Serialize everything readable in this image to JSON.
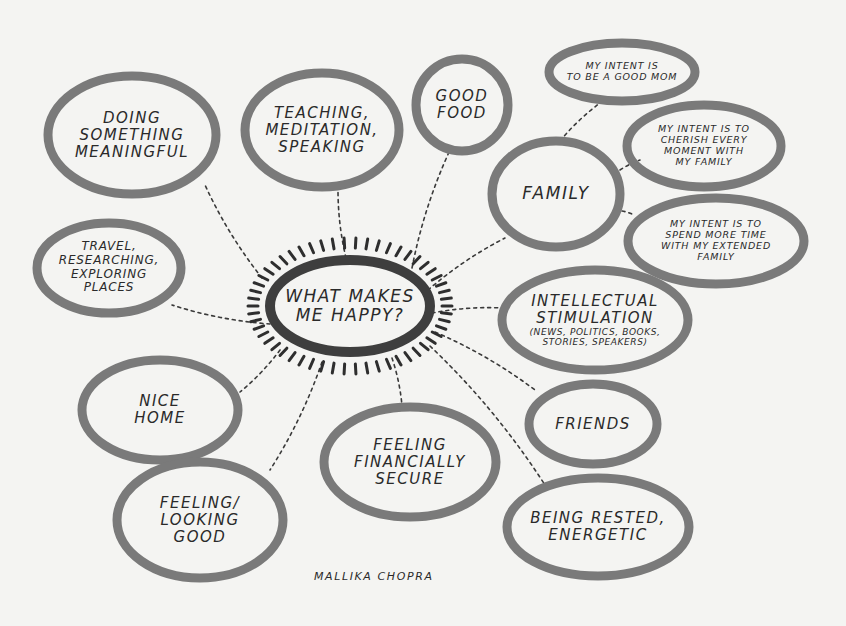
{
  "diagram": {
    "type": "mind-map",
    "center": {
      "id": "center",
      "lines": [
        "WHAT MAKES",
        "ME HAPPY?"
      ],
      "cx": 350,
      "cy": 306,
      "rx": 80,
      "ry": 46
    },
    "nodes": [
      {
        "id": "meaningful",
        "lines": [
          "DOING",
          "SOMETHING",
          "MEANINGFUL"
        ],
        "cx": 132,
        "cy": 135,
        "rx": 84,
        "ry": 59,
        "size": "med",
        "parent": "center"
      },
      {
        "id": "teaching",
        "lines": [
          "TEACHING,",
          "MEDITATION,",
          "SPEAKING"
        ],
        "cx": 322,
        "cy": 130,
        "rx": 77,
        "ry": 57,
        "size": "med",
        "parent": "center"
      },
      {
        "id": "good-food",
        "lines": [
          "GOOD",
          "FOOD"
        ],
        "cx": 462,
        "cy": 105,
        "rx": 46,
        "ry": 46,
        "size": "med",
        "parent": "center"
      },
      {
        "id": "family",
        "lines": [
          "FAMILY"
        ],
        "cx": 556,
        "cy": 194,
        "rx": 64,
        "ry": 53,
        "size": "big",
        "parent": "center"
      },
      {
        "id": "good-mom",
        "lines": [
          "MY INTENT IS",
          "TO BE A GOOD MOM"
        ],
        "cx": 622,
        "cy": 72,
        "rx": 73,
        "ry": 29,
        "size": "small",
        "parent": "family"
      },
      {
        "id": "cherish",
        "lines": [
          "MY INTENT IS TO",
          "CHERISH EVERY",
          "MOMENT WITH",
          "MY FAMILY"
        ],
        "cx": 704,
        "cy": 146,
        "rx": 77,
        "ry": 41,
        "size": "small",
        "parent": "family"
      },
      {
        "id": "extended-family",
        "lines": [
          "MY INTENT IS TO",
          "SPEND MORE TIME",
          "WITH MY EXTENDED",
          "FAMILY"
        ],
        "cx": 716,
        "cy": 241,
        "rx": 88,
        "ry": 43,
        "size": "small",
        "parent": "family"
      },
      {
        "id": "intellectual",
        "lines": [
          "INTELLECTUAL",
          "STIMULATION"
        ],
        "sub": [
          "(NEWS, POLITICS, BOOKS,",
          "STORIES, SPEAKERS)"
        ],
        "cx": 595,
        "cy": 320,
        "rx": 93,
        "ry": 50,
        "size": "med",
        "parent": "center"
      },
      {
        "id": "travel",
        "lines": [
          "TRAVEL,",
          "RESEARCHING,",
          "EXPLORING",
          "PLACES"
        ],
        "cx": 109,
        "cy": 268,
        "rx": 72,
        "ry": 45,
        "size": "small-med",
        "parent": "center"
      },
      {
        "id": "nice-home",
        "lines": [
          "NICE",
          "HOME"
        ],
        "cx": 160,
        "cy": 410,
        "rx": 78,
        "ry": 50,
        "size": "med",
        "parent": "center"
      },
      {
        "id": "looking-good",
        "lines": [
          "FEELING/",
          "LOOKING",
          "GOOD"
        ],
        "cx": 200,
        "cy": 520,
        "rx": 83,
        "ry": 58,
        "size": "med",
        "parent": "center"
      },
      {
        "id": "financially-secure",
        "lines": [
          "FEELING",
          "FINANCIALLY",
          "SECURE"
        ],
        "cx": 410,
        "cy": 462,
        "rx": 86,
        "ry": 55,
        "size": "med",
        "parent": "center"
      },
      {
        "id": "friends",
        "lines": [
          "FRIENDS"
        ],
        "cx": 593,
        "cy": 424,
        "rx": 64,
        "ry": 40,
        "size": "med",
        "parent": "center"
      },
      {
        "id": "rested",
        "lines": [
          "BEING RESTED,",
          "ENERGETIC"
        ],
        "cx": 598,
        "cy": 527,
        "rx": 91,
        "ry": 49,
        "size": "med",
        "parent": "center"
      }
    ],
    "links": [
      {
        "from": [
          262,
          278
        ],
        "to": [
          205,
          185
        ]
      },
      {
        "from": [
          346,
          258
        ],
        "to": [
          338,
          188
        ]
      },
      {
        "from": [
          412,
          268
        ],
        "to": [
          450,
          150
        ]
      },
      {
        "from": [
          428,
          290
        ],
        "to": [
          505,
          238
        ]
      },
      {
        "from": [
          560,
          141
        ],
        "to": [
          600,
          103
        ]
      },
      {
        "from": [
          620,
          170
        ],
        "to": [
          640,
          160
        ]
      },
      {
        "from": [
          622,
          211
        ],
        "to": [
          632,
          214
        ]
      },
      {
        "from": [
          432,
          313
        ],
        "to": [
          503,
          308
        ]
      },
      {
        "from": [
          270,
          324
        ],
        "to": [
          172,
          305
        ]
      },
      {
        "from": [
          280,
          350
        ],
        "to": [
          240,
          392
        ]
      },
      {
        "from": [
          322,
          362
        ],
        "to": [
          270,
          470
        ]
      },
      {
        "from": [
          392,
          358
        ],
        "to": [
          402,
          406
        ]
      },
      {
        "from": [
          435,
          332
        ],
        "to": [
          535,
          390
        ]
      },
      {
        "from": [
          430,
          346
        ],
        "to": [
          545,
          485
        ]
      }
    ],
    "signature": "MALLIKA CHOPRA",
    "colors": {
      "background": "#f4f4f2",
      "bubble_stroke": "#7a7a7a",
      "center_stroke": "#3e3e3e",
      "text": "#2a2a2a",
      "link": "#3a3a3a"
    }
  }
}
